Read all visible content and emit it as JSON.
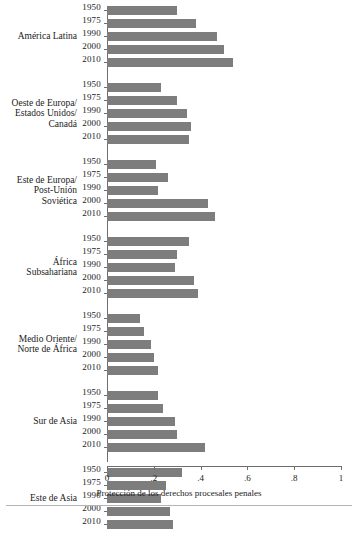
{
  "chart_data": {
    "type": "bar",
    "orientation": "horizontal",
    "title": "",
    "xlabel": "Protección de los derechos procesales penales",
    "ylabel": "",
    "xlim": [
      0,
      1
    ],
    "xticks": [
      "0",
      ".2",
      ".4",
      ".6",
      ".8",
      "1"
    ],
    "xtick_values": [
      0,
      0.2,
      0.4,
      0.6,
      0.8,
      1
    ],
    "grid": false,
    "legend": false,
    "bar_color": "#7d7d7d",
    "years": [
      "1950",
      "1975",
      "1990",
      "2000",
      "2010"
    ],
    "groups": [
      {
        "label": "América Latina",
        "label_lines": [
          "América Latina"
        ],
        "categories": [
          "1950",
          "1975",
          "1990",
          "2000",
          "2010"
        ],
        "values": [
          0.3,
          0.38,
          0.47,
          0.5,
          0.54
        ]
      },
      {
        "label": "Oeste de Europa/ Estados Unidos/ Canadá",
        "label_lines": [
          "Oeste de Europa/",
          "Estados Unidos/",
          "Canadá"
        ],
        "categories": [
          "1950",
          "1975",
          "1990",
          "2000",
          "2010"
        ],
        "values": [
          0.23,
          0.3,
          0.34,
          0.36,
          0.35
        ]
      },
      {
        "label": "Este de Europa/ Post-Unión Soviética",
        "label_lines": [
          "Este de Europa/",
          "Post-Unión",
          "Soviética"
        ],
        "categories": [
          "1950",
          "1975",
          "1990",
          "2000",
          "2010"
        ],
        "values": [
          0.21,
          0.26,
          0.22,
          0.43,
          0.46
        ]
      },
      {
        "label": "África Subsahariana",
        "label_lines": [
          "África",
          "Subsahariana"
        ],
        "categories": [
          "1950",
          "1975",
          "1990",
          "2000",
          "2010"
        ],
        "values": [
          0.35,
          0.3,
          0.29,
          0.37,
          0.39
        ]
      },
      {
        "label": "Medio Oriente/ Norte de África",
        "label_lines": [
          "Medio Oriente/",
          "Norte de África"
        ],
        "categories": [
          "1950",
          "1975",
          "1990",
          "2000",
          "2010"
        ],
        "values": [
          0.14,
          0.16,
          0.19,
          0.2,
          0.22
        ]
      },
      {
        "label": "Sur de Asia",
        "label_lines": [
          "Sur de Asia"
        ],
        "categories": [
          "1950",
          "1975",
          "1990",
          "2000",
          "2010"
        ],
        "values": [
          0.22,
          0.24,
          0.29,
          0.3,
          0.42
        ]
      },
      {
        "label": "Este de Asia",
        "label_lines": [
          "Este de Asia"
        ],
        "categories": [
          "1950",
          "1975",
          "1990",
          "2000",
          "2010"
        ],
        "values": [
          0.32,
          0.25,
          0.23,
          0.27,
          0.28
        ]
      }
    ]
  }
}
